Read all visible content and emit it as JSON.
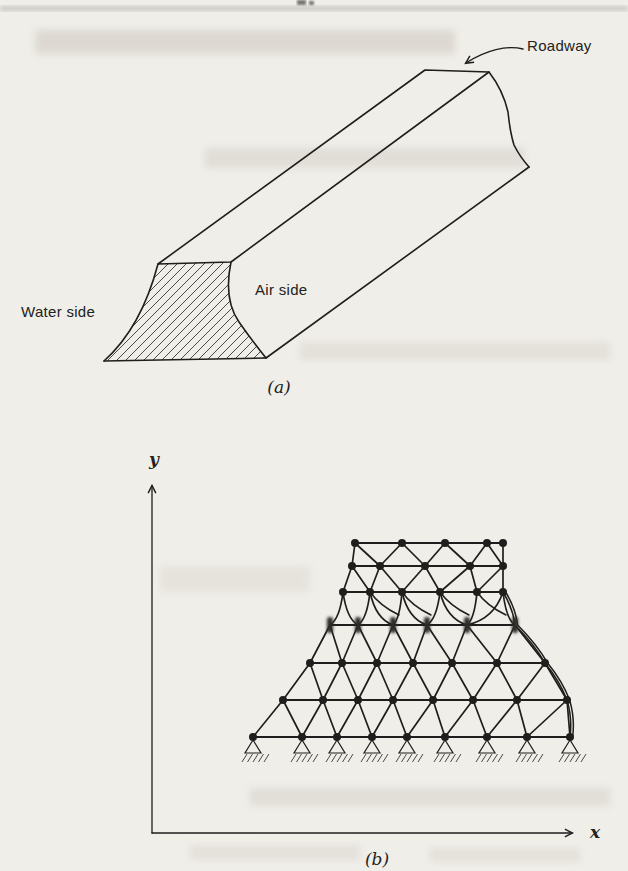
{
  "colors": {
    "ink": "#1f1e1c",
    "paper": "#f0eee9",
    "hatch": "#3a3833",
    "ghost": "#c9c4bb"
  },
  "figure_a": {
    "labels": {
      "roadway": "Roadway",
      "water_side": "Water side",
      "air_side": "Air side"
    },
    "caption": "(a)"
  },
  "figure_b": {
    "axes": {
      "x_label": "x",
      "y_label": "y"
    },
    "caption": "(b)",
    "mesh": {
      "description": "triangulated finite-element mesh of dam cross-section, node rows top to bottom",
      "rows": [
        {
          "y": 543,
          "x": [
            355,
            402,
            445,
            487,
            503
          ]
        },
        {
          "y": 566,
          "x": [
            352,
            380,
            425,
            470,
            503
          ]
        },
        {
          "y": 592,
          "x": [
            343,
            370,
            402,
            440,
            477,
            503
          ]
        },
        {
          "y": 625,
          "x": [
            330,
            358,
            393,
            427,
            467,
            515
          ],
          "blurred": true
        },
        {
          "y": 663,
          "x": [
            310,
            342,
            377,
            413,
            452,
            497,
            545
          ]
        },
        {
          "y": 700,
          "x": [
            283,
            323,
            358,
            393,
            433,
            473,
            517,
            567
          ]
        },
        {
          "y": 737,
          "x": [
            253,
            302,
            337,
            372,
            407,
            445,
            487,
            527,
            570
          ],
          "supports": true
        }
      ]
    }
  }
}
